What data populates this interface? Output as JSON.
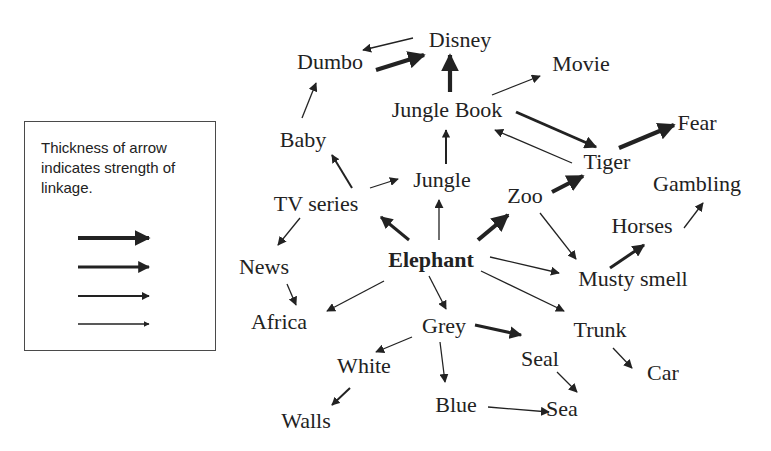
{
  "legend": {
    "text": "Thickness of arrow indicates strength of linkage.",
    "strength_levels": [
      4,
      3,
      2,
      1
    ]
  },
  "nodes": {
    "disney": {
      "label": "Disney",
      "x": 460,
      "y": 40
    },
    "dumbo": {
      "label": "Dumbo",
      "x": 330,
      "y": 62
    },
    "movie": {
      "label": "Movie",
      "x": 581,
      "y": 64
    },
    "jungle_book": {
      "label": "Jungle Book",
      "x": 447,
      "y": 110
    },
    "fear": {
      "label": "Fear",
      "x": 697,
      "y": 123
    },
    "baby": {
      "label": "Baby",
      "x": 303,
      "y": 140
    },
    "tiger": {
      "label": "Tiger",
      "x": 607,
      "y": 162
    },
    "jungle": {
      "label": "Jungle",
      "x": 442,
      "y": 180
    },
    "gambling": {
      "label": "Gambling",
      "x": 697,
      "y": 184
    },
    "tv_series": {
      "label": "TV series",
      "x": 316,
      "y": 204
    },
    "zoo": {
      "label": "Zoo",
      "x": 525,
      "y": 196
    },
    "horses": {
      "label": "Horses",
      "x": 642,
      "y": 226
    },
    "elephant": {
      "label": "Elephant",
      "x": 431,
      "y": 260,
      "bold": true
    },
    "news": {
      "label": "News",
      "x": 264,
      "y": 267
    },
    "musty_smell": {
      "label": "Musty smell",
      "x": 633,
      "y": 279
    },
    "africa": {
      "label": "Africa",
      "x": 279,
      "y": 322
    },
    "grey": {
      "label": "Grey",
      "x": 444,
      "y": 326
    },
    "trunk": {
      "label": "Trunk",
      "x": 600,
      "y": 330
    },
    "white": {
      "label": "White",
      "x": 364,
      "y": 366
    },
    "seal": {
      "label": "Seal",
      "x": 540,
      "y": 359
    },
    "car": {
      "label": "Car",
      "x": 663,
      "y": 373
    },
    "blue": {
      "label": "Blue",
      "x": 456,
      "y": 405
    },
    "sea": {
      "label": "Sea",
      "x": 562,
      "y": 409
    },
    "walls": {
      "label": "Walls",
      "x": 306,
      "y": 421
    }
  },
  "edges": [
    {
      "from": "disney",
      "to": "dumbo",
      "strength": 1,
      "x1": 413,
      "y1": 38,
      "x2": 363,
      "y2": 50
    },
    {
      "from": "dumbo",
      "to": "disney",
      "strength": 4,
      "x1": 376,
      "y1": 70,
      "x2": 424,
      "y2": 55
    },
    {
      "from": "jungle_book",
      "to": "disney",
      "strength": 4,
      "x1": 450,
      "y1": 92,
      "x2": 450,
      "y2": 55
    },
    {
      "from": "jungle_book",
      "to": "movie",
      "strength": 1,
      "x1": 492,
      "y1": 95,
      "x2": 540,
      "y2": 76
    },
    {
      "from": "jungle_book",
      "to": "tiger",
      "strength": 3,
      "x1": 516,
      "y1": 112,
      "x2": 596,
      "y2": 147
    },
    {
      "from": "tiger",
      "to": "jungle_book",
      "strength": 1,
      "x1": 572,
      "y1": 163,
      "x2": 495,
      "y2": 130
    },
    {
      "from": "tiger",
      "to": "fear",
      "strength": 4,
      "x1": 619,
      "y1": 148,
      "x2": 674,
      "y2": 125
    },
    {
      "from": "baby",
      "to": "dumbo",
      "strength": 1,
      "x1": 302,
      "y1": 118,
      "x2": 316,
      "y2": 83
    },
    {
      "from": "tv_series",
      "to": "baby",
      "strength": 2,
      "x1": 352,
      "y1": 188,
      "x2": 332,
      "y2": 155
    },
    {
      "from": "tv_series",
      "to": "jungle",
      "strength": 1,
      "x1": 370,
      "y1": 188,
      "x2": 398,
      "y2": 179
    },
    {
      "from": "jungle",
      "to": "jungle_book",
      "strength": 2,
      "x1": 446,
      "y1": 164,
      "x2": 446,
      "y2": 130
    },
    {
      "from": "elephant",
      "to": "jungle",
      "strength": 1,
      "x1": 439,
      "y1": 240,
      "x2": 439,
      "y2": 200
    },
    {
      "from": "elephant",
      "to": "tv_series",
      "strength": 3,
      "x1": 409,
      "y1": 240,
      "x2": 381,
      "y2": 217
    },
    {
      "from": "elephant",
      "to": "zoo",
      "strength": 4,
      "x1": 478,
      "y1": 240,
      "x2": 508,
      "y2": 215
    },
    {
      "from": "zoo",
      "to": "tiger",
      "strength": 4,
      "x1": 552,
      "y1": 192,
      "x2": 583,
      "y2": 176
    },
    {
      "from": "zoo",
      "to": "musty_smell",
      "strength": 1,
      "x1": 540,
      "y1": 213,
      "x2": 576,
      "y2": 259
    },
    {
      "from": "elephant",
      "to": "musty_smell",
      "strength": 1,
      "x1": 490,
      "y1": 257,
      "x2": 559,
      "y2": 273
    },
    {
      "from": "musty_smell",
      "to": "horses",
      "strength": 3,
      "x1": 610,
      "y1": 268,
      "x2": 644,
      "y2": 245
    },
    {
      "from": "horses",
      "to": "gambling",
      "strength": 1,
      "x1": 684,
      "y1": 228,
      "x2": 703,
      "y2": 203
    },
    {
      "from": "elephant",
      "to": "trunk",
      "strength": 1,
      "x1": 481,
      "y1": 271,
      "x2": 564,
      "y2": 311
    },
    {
      "from": "tv_series",
      "to": "news",
      "strength": 1,
      "x1": 300,
      "y1": 218,
      "x2": 278,
      "y2": 245
    },
    {
      "from": "news",
      "to": "africa",
      "strength": 1,
      "x1": 287,
      "y1": 284,
      "x2": 296,
      "y2": 305
    },
    {
      "from": "elephant",
      "to": "africa",
      "strength": 1,
      "x1": 384,
      "y1": 281,
      "x2": 327,
      "y2": 311
    },
    {
      "from": "elephant",
      "to": "grey",
      "strength": 1,
      "x1": 429,
      "y1": 276,
      "x2": 446,
      "y2": 309
    },
    {
      "from": "grey",
      "to": "white",
      "strength": 1,
      "x1": 412,
      "y1": 337,
      "x2": 376,
      "y2": 352
    },
    {
      "from": "grey",
      "to": "blue",
      "strength": 1,
      "x1": 440,
      "y1": 342,
      "x2": 445,
      "y2": 382
    },
    {
      "from": "grey",
      "to": "seal",
      "strength": 3,
      "x1": 475,
      "y1": 325,
      "x2": 521,
      "y2": 335
    },
    {
      "from": "white",
      "to": "walls",
      "strength": 2,
      "x1": 350,
      "y1": 388,
      "x2": 332,
      "y2": 405
    },
    {
      "from": "seal",
      "to": "sea",
      "strength": 1,
      "x1": 557,
      "y1": 372,
      "x2": 577,
      "y2": 392
    },
    {
      "from": "blue",
      "to": "sea",
      "strength": 1,
      "x1": 488,
      "y1": 407,
      "x2": 549,
      "y2": 412
    },
    {
      "from": "trunk",
      "to": "car",
      "strength": 1,
      "x1": 613,
      "y1": 348,
      "x2": 632,
      "y2": 368
    }
  ],
  "colors": {
    "ink": "#222222",
    "border": "#4a4a4a",
    "background": "#ffffff"
  }
}
